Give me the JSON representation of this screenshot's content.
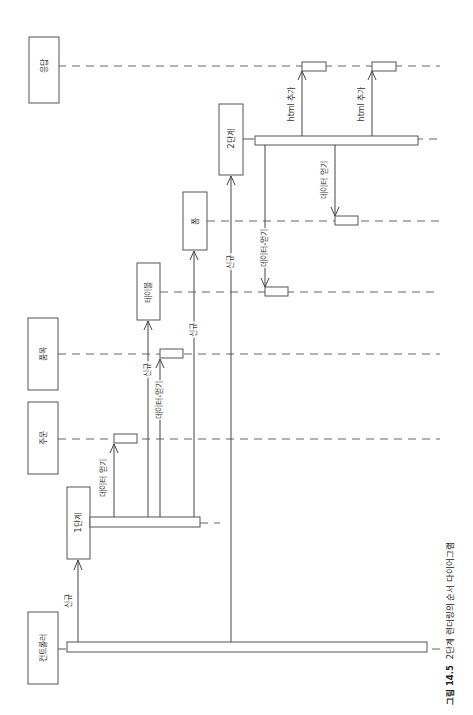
{
  "diagram": {
    "type": "sequence-diagram",
    "orientation": "rotated-90-ccw",
    "participants": [
      {
        "id": "controller",
        "label": "컨트롤러"
      },
      {
        "id": "order",
        "label": "주문"
      },
      {
        "id": "item",
        "label": "품목"
      },
      {
        "id": "response",
        "label": "응답"
      },
      {
        "id": "step1",
        "label": "1단계"
      },
      {
        "id": "table",
        "label": "테이블"
      },
      {
        "id": "form",
        "label": "폼"
      },
      {
        "id": "step2",
        "label": "2단계"
      }
    ],
    "messages": [
      {
        "from": "controller",
        "to": "step1",
        "label": "신규"
      },
      {
        "from": "step1",
        "to": "order",
        "label": "데이터 얻기"
      },
      {
        "from": "step1",
        "to": "table",
        "label": "신규"
      },
      {
        "from": "step1",
        "to": "item",
        "label": "데이터 얻기"
      },
      {
        "from": "step1",
        "to": "form",
        "label": "신규"
      },
      {
        "from": "controller",
        "to": "step2",
        "label": "신규"
      },
      {
        "from": "step2",
        "to": "table",
        "label": "데이터 얻기"
      },
      {
        "from": "step2",
        "to": "form",
        "label": "데이터 얻기"
      },
      {
        "from": "step2",
        "to": "response",
        "label": "html 추가"
      },
      {
        "from": "step2",
        "to": "response",
        "label": "html 추가"
      }
    ]
  },
  "caption": {
    "number": "그림 14.5",
    "text": "2단계 렌더링의 순서 다이어그램"
  }
}
